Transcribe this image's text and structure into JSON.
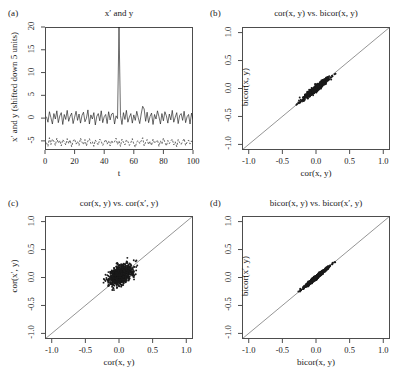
{
  "figure": {
    "width": 404,
    "height": 381,
    "background": "#ffffff",
    "ink": "#1a1a1a",
    "axis_color": "#4d4d4d"
  },
  "panels": [
    {
      "tag": "(a)",
      "title": "x′ and y",
      "xlabel": "t",
      "ylabel": "x′ and y (shifted down 5 units)",
      "xticks": [
        "0",
        "20",
        "40",
        "60",
        "80",
        "100"
      ],
      "yticks": [
        "-5",
        "0",
        "5",
        "10",
        "15",
        "20"
      ]
    },
    {
      "tag": "(b)",
      "title": "cor(x, y) vs. bicor(x, y)",
      "xlabel": "cor(x, y)",
      "ylabel": "bicor(x, y)",
      "xticks": [
        "-1.0",
        "-0.5",
        "0.0",
        "0.5",
        "1.0"
      ],
      "yticks": [
        "-1.0",
        "-0.5",
        "0.0",
        "0.5",
        "1.0"
      ]
    },
    {
      "tag": "(c)",
      "title": "cor(x, y) vs. cor(x′, y)",
      "xlabel": "cor(x, y)",
      "ylabel": "cor(x′, y)",
      "xticks": [
        "-1.0",
        "-0.5",
        "0.0",
        "0.5",
        "1.0"
      ],
      "yticks": [
        "-1.0",
        "-0.5",
        "0.0",
        "0.5",
        "1.0"
      ]
    },
    {
      "tag": "(d)",
      "title": "bicor(x, y) vs. bicor(x′, y)",
      "xlabel": "bicor(x, y)",
      "ylabel": "bicor(x′, y)",
      "xticks": [
        "-1.0",
        "-0.5",
        "0.0",
        "0.5",
        "1.0"
      ],
      "yticks": [
        "-1.0",
        "-0.5",
        "0.0",
        "0.5",
        "1.0"
      ]
    }
  ],
  "chart_data": [
    {
      "panel": "(a)",
      "type": "line",
      "title": "x′ and y",
      "xlabel": "t",
      "ylabel": "x′ and y (shifted down 5 units)",
      "xlim": [
        0,
        100
      ],
      "ylim": [
        -7,
        20
      ],
      "grid": false,
      "legend": "none",
      "annotations": [
        "outlier spike in x′ at t = 50 reaching value 20",
        "y series offset downward by 5 units, drawn dashed"
      ],
      "series": [
        {
          "name": "x′ (solid line, noise with single large outlier at t=50)",
          "style": "solid",
          "x": [
            1,
            2,
            3,
            4,
            5,
            6,
            7,
            8,
            9,
            10,
            11,
            12,
            13,
            14,
            15,
            16,
            17,
            18,
            19,
            20,
            21,
            22,
            23,
            24,
            25,
            26,
            27,
            28,
            29,
            30,
            31,
            32,
            33,
            34,
            35,
            36,
            37,
            38,
            39,
            40,
            41,
            42,
            43,
            44,
            45,
            46,
            47,
            48,
            49,
            50,
            51,
            52,
            53,
            54,
            55,
            56,
            57,
            58,
            59,
            60,
            61,
            62,
            63,
            64,
            65,
            66,
            67,
            68,
            69,
            70,
            71,
            72,
            73,
            74,
            75,
            76,
            77,
            78,
            79,
            80,
            81,
            82,
            83,
            84,
            85,
            86,
            87,
            88,
            89,
            90,
            91,
            92,
            93,
            94,
            95,
            96,
            97,
            98,
            99,
            100
          ],
          "values": [
            0.3,
            -0.9,
            1.4,
            0.1,
            -1.3,
            1.0,
            -0.2,
            1.6,
            -1.0,
            0.5,
            1.2,
            -1.4,
            0.8,
            -0.3,
            1.7,
            -0.7,
            0.4,
            1.1,
            -1.2,
            0.2,
            1.5,
            -0.5,
            0.9,
            -1.1,
            0.6,
            1.3,
            -0.8,
            0.0,
            1.8,
            -1.3,
            0.7,
            -0.2,
            1.2,
            -1.5,
            0.4,
            1.0,
            -0.6,
            1.6,
            -1.0,
            0.3,
            0.8,
            -1.2,
            1.4,
            -0.4,
            0.9,
            1.1,
            -1.3,
            0.5,
            -0.1,
            20.0,
            0.6,
            -1.4,
            1.2,
            -0.3,
            1.7,
            -0.9,
            0.2,
            1.0,
            -1.1,
            0.7,
            -0.5,
            1.5,
            0.1,
            -1.2,
            0.9,
            2.6,
            2.0,
            -0.7,
            1.3,
            -1.0,
            0.4,
            1.1,
            -1.4,
            0.8,
            -0.2,
            1.6,
            0.3,
            -1.3,
            1.0,
            -0.6,
            1.4,
            0.5,
            -1.1,
            0.9,
            -0.4,
            1.7,
            -0.9,
            0.2,
            1.2,
            -1.2,
            0.6,
            1.0,
            -0.5,
            1.5,
            -1.0,
            0.3,
            0.8,
            -1.3,
            1.1,
            -0.3
          ]
        },
        {
          "name": "y (dashed line, shifted down 5 units)",
          "style": "dashed",
          "x": [
            1,
            2,
            3,
            4,
            5,
            6,
            7,
            8,
            9,
            10,
            11,
            12,
            13,
            14,
            15,
            16,
            17,
            18,
            19,
            20,
            21,
            22,
            23,
            24,
            25,
            26,
            27,
            28,
            29,
            30,
            31,
            32,
            33,
            34,
            35,
            36,
            37,
            38,
            39,
            40,
            41,
            42,
            43,
            44,
            45,
            46,
            47,
            48,
            49,
            50,
            51,
            52,
            53,
            54,
            55,
            56,
            57,
            58,
            59,
            60,
            61,
            62,
            63,
            64,
            65,
            66,
            67,
            68,
            69,
            70,
            71,
            72,
            73,
            74,
            75,
            76,
            77,
            78,
            79,
            80,
            81,
            82,
            83,
            84,
            85,
            86,
            87,
            88,
            89,
            90,
            91,
            92,
            93,
            94,
            95,
            96,
            97,
            98,
            99,
            100
          ],
          "values": [
            -5.4,
            -6.2,
            -4.3,
            -5.8,
            -4.6,
            -5.1,
            -6.0,
            -4.4,
            -5.5,
            -4.9,
            -6.1,
            -4.7,
            -5.2,
            -5.9,
            -4.5,
            -5.6,
            -4.8,
            -6.3,
            -5.0,
            -4.6,
            -5.7,
            -5.1,
            -6.0,
            -4.4,
            -5.3,
            -5.8,
            -4.7,
            -6.1,
            -5.0,
            -4.5,
            -5.6,
            -5.2,
            -6.2,
            -4.8,
            -5.4,
            -5.9,
            -4.6,
            -5.1,
            -6.0,
            -5.3,
            -4.7,
            -5.7,
            -5.0,
            -6.1,
            -4.9,
            -5.5,
            -5.2,
            -4.4,
            -5.8,
            -5.0,
            -6.2,
            -4.6,
            -5.3,
            -5.9,
            -4.8,
            -5.1,
            -6.0,
            -5.4,
            -4.5,
            -5.7,
            -6.4,
            -5.2,
            -4.9,
            -5.6,
            -5.0,
            -4.3,
            -6.1,
            -5.3,
            -4.7,
            -5.8,
            -5.1,
            -6.0,
            -4.6,
            -5.5,
            -5.2,
            -4.8,
            -6.2,
            -5.0,
            -5.7,
            -4.4,
            -5.3,
            -6.1,
            -4.9,
            -5.6,
            -5.0,
            -4.6,
            -5.9,
            -5.2,
            -6.3,
            -4.7,
            -5.4,
            -5.8,
            -5.1,
            -4.5,
            -6.0,
            -5.3,
            -4.8,
            -5.7,
            -5.0,
            -5.5
          ]
        }
      ]
    },
    {
      "panel": "(b)",
      "type": "scatter",
      "title": "cor(x, y) vs. bicor(x, y)",
      "xlabel": "cor(x, y)",
      "ylabel": "bicor(x, y)",
      "xlim": [
        -1.1,
        1.1
      ],
      "ylim": [
        -1.1,
        1.1
      ],
      "xticks": [
        -1.0,
        -0.5,
        0.0,
        0.5,
        1.0
      ],
      "yticks": [
        -1.0,
        -0.5,
        0.0,
        0.5,
        1.0
      ],
      "grid": false,
      "legend": "none",
      "reference_line": {
        "type": "identity",
        "slope": 1,
        "intercept": 0
      },
      "n_points": 1000,
      "cloud": {
        "center": [
          0.0,
          0.0
        ],
        "sd_along": 0.12,
        "sd_across": 0.018,
        "angle_deg": 45,
        "span": [
          -0.33,
          0.3
        ]
      },
      "annotations": [
        "points lie very tightly on the y = x line"
      ]
    },
    {
      "panel": "(c)",
      "type": "scatter",
      "title": "cor(x, y) vs. cor(x′, y)",
      "xlabel": "cor(x, y)",
      "ylabel": "cor(x′, y)",
      "xlim": [
        -1.1,
        1.1
      ],
      "ylim": [
        -1.1,
        1.1
      ],
      "xticks": [
        -1.0,
        -0.5,
        0.0,
        0.5,
        1.0
      ],
      "yticks": [
        -1.0,
        -0.5,
        0.0,
        0.5,
        1.0
      ],
      "grid": false,
      "legend": "none",
      "reference_line": {
        "type": "identity",
        "slope": 1,
        "intercept": 0
      },
      "n_points": 1000,
      "cloud": {
        "center": [
          0.02,
          0.04
        ],
        "sd_along": 0.105,
        "sd_across": 0.065,
        "angle_deg": 45,
        "span": [
          -0.3,
          0.3
        ]
      },
      "annotations": [
        "broad diffuse blob, weak agreement between cor(x, y) and cor(x′, y)"
      ]
    },
    {
      "panel": "(d)",
      "type": "scatter",
      "title": "bicor(x, y) vs. bicor(x′, y)",
      "xlabel": "bicor(x, y)",
      "ylabel": "bicor(x′, y)",
      "xlim": [
        -1.1,
        1.1
      ],
      "ylim": [
        -1.1,
        1.1
      ],
      "xticks": [
        -1.0,
        -0.5,
        0.0,
        0.5,
        1.0
      ],
      "yticks": [
        -1.0,
        -0.5,
        0.0,
        0.5,
        1.0
      ],
      "grid": false,
      "legend": "none",
      "reference_line": {
        "type": "identity",
        "slope": 1,
        "intercept": 0
      },
      "n_points": 1000,
      "cloud": {
        "center": [
          0.0,
          0.0
        ],
        "sd_along": 0.125,
        "sd_across": 0.011,
        "angle_deg": 45,
        "span": [
          -0.33,
          0.33
        ]
      },
      "annotations": [
        "nearly perfect agreement, points collapse onto the y = x line"
      ]
    }
  ]
}
